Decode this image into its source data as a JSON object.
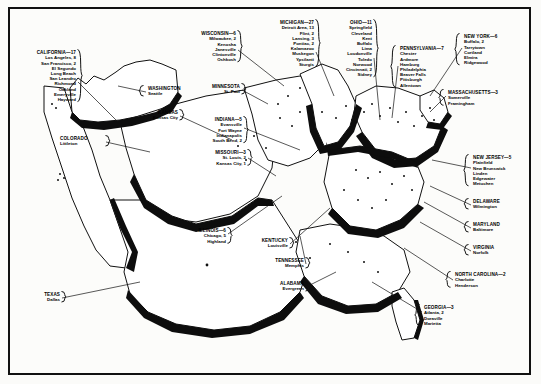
{
  "figure": {
    "kind": "map-illustration",
    "region": "United States",
    "style": "black-and-white shaded relief state blocks with bracketed callout labels"
  },
  "labels": [
    {
      "id": "california",
      "state": "CALIFORNIA—17",
      "align": "right",
      "bracket": "right",
      "cities": [
        "Los Angeles, 8",
        "San Francisco, 2",
        "El Segundo",
        "Long Beach",
        "San Leandro",
        "Richmond",
        "Oakland",
        "Emeryville",
        "Hayward"
      ],
      "x": 18,
      "y": 50,
      "w": 58,
      "leader": [
        [
          78,
          82
        ],
        [
          118,
          122
        ]
      ]
    },
    {
      "id": "washington",
      "state": "WASHINGTON",
      "align": "left",
      "bracket": "left",
      "cities": [
        "Seattle"
      ],
      "x": 148,
      "y": 86,
      "w": 44,
      "leader": [
        [
          146,
          92
        ],
        [
          118,
          86
        ]
      ]
    },
    {
      "id": "kansas",
      "state": "KANSAS",
      "align": "right",
      "bracket": "right",
      "cities": [
        "Kansas City"
      ],
      "x": 132,
      "y": 110,
      "w": 46,
      "leader": [
        [
          180,
          116
        ],
        [
          232,
          140
        ]
      ]
    },
    {
      "id": "colorado",
      "state": "COLORADO",
      "align": "left",
      "bracket": "right",
      "cities": [
        "Littleton"
      ],
      "x": 60,
      "y": 136,
      "w": 44,
      "leader": [
        [
          106,
          142
        ],
        [
          150,
          152
        ]
      ]
    },
    {
      "id": "minnesota",
      "state": "MINNESOTA",
      "align": "right",
      "bracket": "right",
      "cities": [
        "St. Paul"
      ],
      "x": 196,
      "y": 84,
      "w": 44,
      "leader": [
        [
          242,
          90
        ],
        [
          268,
          104
        ]
      ]
    },
    {
      "id": "indiana",
      "state": "INDIANA—5",
      "align": "right",
      "bracket": "right",
      "cities": [
        "Evansville",
        "Fort Wayne",
        "Indianapolis",
        "South Bend, 2"
      ],
      "x": 196,
      "y": 117,
      "w": 46,
      "leader": [
        [
          244,
          128
        ],
        [
          300,
          150
        ]
      ]
    },
    {
      "id": "missouri",
      "state": "MISSOURI—3",
      "align": "right",
      "bracket": "right",
      "cities": [
        "St. Louis, 2",
        "Kansas City, 1"
      ],
      "x": 200,
      "y": 150,
      "w": 46,
      "leader": [
        [
          248,
          158
        ],
        [
          276,
          176
        ]
      ]
    },
    {
      "id": "wisconsin",
      "state": "WISCONSIN—6",
      "align": "right",
      "bracket": "right",
      "cities": [
        "Milwaukee, 2",
        "Kenosha",
        "Janesville",
        "Clintonville",
        "Oshkosh"
      ],
      "x": 186,
      "y": 31,
      "w": 50,
      "leader": [
        [
          238,
          50
        ],
        [
          284,
          86
        ]
      ]
    },
    {
      "id": "michigan",
      "state": "MICHIGAN—27",
      "align": "right",
      "bracket": "right",
      "cities": [
        "Detroit Area, 13",
        "Flint, 2",
        "Lansing, 3",
        "Pontiac, 2",
        "Kalamazoo",
        "Muskegon",
        "Ypsilanti",
        "Sturgis"
      ],
      "x": 258,
      "y": 20,
      "w": 56,
      "leader": [
        [
          316,
          52
        ],
        [
          334,
          96
        ]
      ]
    },
    {
      "id": "ohio",
      "state": "OHIO—11",
      "align": "right",
      "bracket": "right",
      "cities": [
        "Springfield",
        "Cleveland",
        "Kent",
        "Buffalo",
        "Lima",
        "Loudonville",
        "Toledo",
        "Norwood",
        "Cincinnati, 2",
        "Sidney"
      ],
      "x": 324,
      "y": 20,
      "w": 48,
      "leader": [
        [
          374,
          58
        ],
        [
          380,
          120
        ]
      ]
    },
    {
      "id": "pennsylvania",
      "state": "PENNSYLVANIA—7",
      "align": "left",
      "bracket": "left",
      "cities": [
        "Chester",
        "Ardmore",
        "Hamburg",
        "Philadelphia",
        "Beaver Falls",
        "Pittsburgh",
        "Allentown"
      ],
      "x": 400,
      "y": 46,
      "w": 54,
      "leader": [
        [
          398,
          66
        ],
        [
          392,
          118
        ]
      ]
    },
    {
      "id": "newyork",
      "state": "NEW YORK—6",
      "align": "left",
      "bracket": "left",
      "cities": [
        "Buffalo, 2",
        "Tarrytown",
        "Cortland",
        "Elmira",
        "Ridgewood"
      ],
      "x": 464,
      "y": 34,
      "w": 50,
      "leader": [
        [
          462,
          48
        ],
        [
          430,
          96
        ]
      ]
    },
    {
      "id": "massachusetts",
      "state": "MASSACHUSETTS—3",
      "align": "left",
      "bracket": "left",
      "cities": [
        "Somerville",
        "Framingham"
      ],
      "x": 448,
      "y": 90,
      "w": 58,
      "leader": [
        [
          446,
          96
        ],
        [
          430,
          112
        ]
      ]
    },
    {
      "id": "newjersey",
      "state": "NEW JERSEY—5",
      "align": "left",
      "bracket": "left",
      "cities": [
        "Plainfield",
        "New Brunswick",
        "Linden",
        "Edgewater",
        "Metuchen"
      ],
      "x": 473,
      "y": 155,
      "w": 52,
      "leader": [
        [
          471,
          168
        ],
        [
          432,
          160
        ]
      ]
    },
    {
      "id": "delaware",
      "state": "DELAWARE",
      "align": "left",
      "bracket": "left",
      "cities": [
        "Wilmington"
      ],
      "x": 473,
      "y": 199,
      "w": 44,
      "leader": [
        [
          471,
          205
        ],
        [
          430,
          186
        ]
      ]
    },
    {
      "id": "maryland",
      "state": "MARYLAND",
      "align": "left",
      "bracket": "left",
      "cities": [
        "Baltimore"
      ],
      "x": 473,
      "y": 222,
      "w": 44,
      "leader": [
        [
          471,
          228
        ],
        [
          424,
          202
        ]
      ]
    },
    {
      "id": "virginia",
      "state": "VIRGINIA",
      "align": "left",
      "bracket": "left",
      "cities": [
        "Norfolk"
      ],
      "x": 473,
      "y": 245,
      "w": 44,
      "leader": [
        [
          471,
          251
        ],
        [
          420,
          222
        ]
      ]
    },
    {
      "id": "northcarolina",
      "state": "NORTH CAROLINA—2",
      "align": "left",
      "bracket": "left",
      "cities": [
        "Charlotte",
        "Henderson"
      ],
      "x": 455,
      "y": 272,
      "w": 62,
      "leader": [
        [
          453,
          280
        ],
        [
          404,
          248
        ]
      ]
    },
    {
      "id": "georgia",
      "state": "GEORGIA—3",
      "align": "left",
      "bracket": "left",
      "cities": [
        "Atlanta, 2",
        "Doraville",
        "Marietta"
      ],
      "x": 424,
      "y": 305,
      "w": 48,
      "leader": [
        [
          422,
          312
        ],
        [
          372,
          282
        ]
      ]
    },
    {
      "id": "illinois",
      "state": "ILLINOIS—6",
      "align": "right",
      "bracket": "right",
      "cities": [
        "Chicago, 5",
        "Highland"
      ],
      "x": 180,
      "y": 228,
      "w": 46,
      "leader": [
        [
          228,
          234
        ],
        [
          282,
          196
        ]
      ]
    },
    {
      "id": "kentucky",
      "state": "KENTUCKY",
      "align": "right",
      "bracket": "right",
      "cities": [
        "Louisville"
      ],
      "x": 242,
      "y": 238,
      "w": 46,
      "leader": [
        [
          290,
          244
        ],
        [
          330,
          208
        ]
      ]
    },
    {
      "id": "tennessee",
      "state": "TENNESSEE",
      "align": "right",
      "bracket": "right",
      "cities": [
        "Memphis"
      ],
      "x": 258,
      "y": 258,
      "w": 46,
      "leader": [
        [
          306,
          264
        ],
        [
          300,
          236
        ]
      ]
    },
    {
      "id": "alabama",
      "state": "ALABAMA",
      "align": "right",
      "bracket": "right",
      "cities": [
        "Evergreen"
      ],
      "x": 258,
      "y": 281,
      "w": 46,
      "leader": [
        [
          306,
          287
        ],
        [
          336,
          272
        ]
      ]
    },
    {
      "id": "texas",
      "state": "TEXAS",
      "align": "right",
      "bracket": "right",
      "cities": [
        "Dallas"
      ],
      "x": 18,
      "y": 292,
      "w": 42,
      "leader": [
        [
          62,
          298
        ],
        [
          140,
          282
        ]
      ]
    }
  ]
}
